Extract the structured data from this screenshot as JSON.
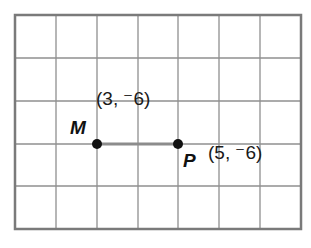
{
  "diagram": {
    "type": "coordinate-grid",
    "grid": {
      "columns": 7,
      "rows": 5,
      "line_color": "#8a8a8a",
      "border_color": "#7a7a7a"
    },
    "segment": {
      "from": "M",
      "to": "P",
      "color": "#8c8c8c"
    },
    "points": [
      {
        "name": "M",
        "label": "M",
        "coords": "(3, ⁻6)",
        "x": 3,
        "y": -6
      },
      {
        "name": "P",
        "label": "P",
        "coords": "(5, ⁻6)",
        "x": 5,
        "y": -6
      }
    ]
  }
}
